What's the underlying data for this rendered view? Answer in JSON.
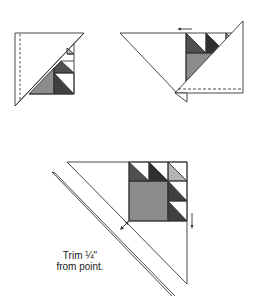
{
  "figures": [
    {
      "id": "step-1",
      "description": "Triangle unit with pieced column and dashed seam along left edge"
    },
    {
      "id": "step-2",
      "description": "Second triangle folded over with left-pointing arrow and dashed seam at bottom"
    },
    {
      "id": "step-3",
      "description": "Assembled block with ruler trimming 1/4 inch from point",
      "caption_line1": "Trim ¼\"",
      "caption_line2": "from point."
    }
  ],
  "colors": {
    "outline": "#333333",
    "light": "#b3b3b3",
    "medium": "#8c8c8c",
    "dark": "#505050",
    "darkest": "#303030"
  }
}
